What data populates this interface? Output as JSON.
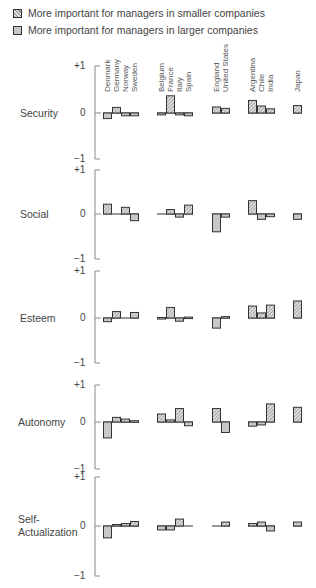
{
  "legend": {
    "smaller": {
      "label": "More important for managers in smaller companies",
      "pattern": "hatched"
    },
    "larger": {
      "label": "More important for managers in larger companies",
      "pattern": "solid-gray"
    }
  },
  "colors": {
    "hatch_dark": "#888888",
    "hatch_light": "#dddddd",
    "solid": "#c8c8c8",
    "stroke": "#333333",
    "axis": "#888888"
  },
  "axis": {
    "top_label": "+1",
    "zero_label": "0",
    "bottom_label": "−1"
  },
  "country_groups": [
    [
      "Denmark",
      "Germany",
      "Norway",
      "Sweden"
    ],
    [
      "Belgium",
      "France",
      "Italy",
      "Spain"
    ],
    [
      "England",
      "United States"
    ],
    [
      "Argentina",
      "Chile",
      "India"
    ],
    [
      "Japan"
    ]
  ],
  "chart_data": {
    "type": "bar",
    "title": "",
    "xlabel": "",
    "ylabel": "",
    "ylim": [
      -1,
      1
    ],
    "note": "Positive = more important for managers in smaller companies (hatched); negative = more important in larger companies (solid gray)",
    "categories": [
      "Denmark",
      "Germany",
      "Norway",
      "Sweden",
      "Belgium",
      "France",
      "Italy",
      "Spain",
      "England",
      "United States",
      "Argentina",
      "Chile",
      "India",
      "Japan"
    ],
    "series": [
      {
        "name": "Security",
        "values": [
          -0.12,
          0.12,
          -0.06,
          -0.06,
          -0.04,
          0.37,
          -0.04,
          -0.06,
          0.13,
          0.1,
          0.27,
          0.15,
          0.09,
          0.16
        ]
      },
      {
        "name": "Social",
        "values": [
          0.22,
          0.0,
          0.15,
          -0.15,
          0.0,
          0.1,
          -0.07,
          0.2,
          -0.4,
          -0.07,
          0.3,
          -0.12,
          -0.06,
          -0.12
        ]
      },
      {
        "name": "Esteem",
        "values": [
          -0.08,
          0.14,
          0.0,
          0.12,
          0.01,
          0.23,
          -0.07,
          0.02,
          -0.22,
          0.03,
          0.26,
          0.11,
          0.28,
          0.37
        ]
      },
      {
        "name": "Autonomy",
        "values": [
          -0.38,
          0.11,
          0.07,
          0.03,
          0.19,
          0.05,
          0.32,
          -0.09,
          0.32,
          -0.25,
          -0.1,
          -0.07,
          0.43,
          0.35
        ]
      },
      {
        "name": "Self-Actualization",
        "values": [
          -0.24,
          0.03,
          0.05,
          0.09,
          -0.08,
          -0.08,
          0.14,
          0.0,
          0.0,
          0.08,
          0.05,
          0.08,
          -0.1,
          0.08
        ]
      }
    ]
  },
  "row_labels": [
    "Security",
    "Social",
    "Esteem",
    "Autonomy",
    "Self-\nActualization"
  ]
}
